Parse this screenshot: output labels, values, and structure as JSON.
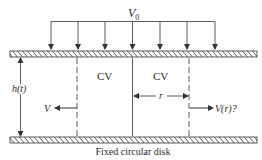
{
  "diagram": {
    "top_load_label": "V",
    "top_load_subscript": "0",
    "cv_left_label": "CV",
    "cv_right_label": "CV",
    "gap_label": "h(t)",
    "radius_label": "r",
    "left_velocity_label": "V",
    "right_velocity_label": "V(r)?",
    "caption": "Fixed circular disk",
    "colors": {
      "line": "#333333",
      "background": "#ffffff"
    }
  }
}
